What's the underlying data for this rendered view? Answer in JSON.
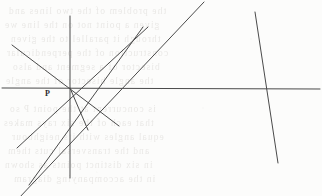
{
  "figure": {
    "width": 322,
    "height": 196,
    "background_color": "#fcfcfb",
    "ink_color": "#4a4a4a",
    "labels": [
      {
        "name": "point-p",
        "text": "P",
        "x": 45,
        "y": 90,
        "color": "#2b2b2b"
      }
    ]
  },
  "chart_data": {
    "type": "line",
    "title": "",
    "xlabel": "",
    "ylabel": "",
    "xlim": [
      0,
      322
    ],
    "ylim": [
      0,
      196
    ],
    "grid": false,
    "legend": "none",
    "coordinate_note": "Pixel coordinates, origin at top-left of the 322x196 image.",
    "key_points": [
      {
        "name": "P",
        "label": "P",
        "x": 70,
        "y": 88
      },
      {
        "name": "Q",
        "label": "",
        "x": 176,
        "y": 88
      },
      {
        "name": "R",
        "label": "",
        "x": 267,
        "y": 89
      }
    ],
    "series": [
      {
        "name": "horizontal-transversal",
        "stroke": "#4a4a4a",
        "width": 1.0,
        "x": [
          2,
          320
        ],
        "y": [
          88,
          89
        ]
      },
      {
        "name": "vertical-line-through-p",
        "stroke": "#4a4a4a",
        "width": 1.0,
        "x": [
          70,
          70
        ],
        "y": [
          16,
          178
        ]
      },
      {
        "name": "diagonal-upper-left-to-lower-right",
        "stroke": "#4a4a4a",
        "width": 1.0,
        "x": [
          12,
          119
        ],
        "y": [
          45,
          126
        ]
      },
      {
        "name": "diagonal-lower-left-to-upper-right",
        "stroke": "#4a4a4a",
        "width": 1.0,
        "x": [
          17,
          148
        ],
        "y": [
          148,
          27
        ]
      },
      {
        "name": "steep-line-through-p-to-lower-right",
        "stroke": "#4a4a4a",
        "width": 1.0,
        "x": [
          70,
          88
        ],
        "y": [
          88,
          130
        ]
      },
      {
        "name": "line-q-upper-left-to-lower-right",
        "stroke": "#4a4a4a",
        "width": 1.0,
        "x": [
          143,
          29
        ],
        "y": [
          27,
          185
        ]
      },
      {
        "name": "line-q-upper-right-to-lower-left",
        "stroke": "#4a4a4a",
        "width": 1.0,
        "x": [
          204,
          2
        ],
        "y": [
          2,
          216
        ]
      },
      {
        "name": "steep-line-right-crossing-transversal",
        "stroke": "#4a4a4a",
        "width": 1.0,
        "x": [
          255,
          278
        ],
        "y": [
          12,
          163
        ]
      }
    ]
  },
  "bleed_through_text": {
    "note": "Faint mirrored text showing through from the reverse side of the page; illegible.",
    "color": "#8a8279",
    "lines": [
      {
        "text": "the problem of the two lines and",
        "x": 8,
        "y": 6
      },
      {
        "text": "given a point not on the line we",
        "x": 4,
        "y": 20
      },
      {
        "text": "through it parallel to the given",
        "x": 10,
        "y": 34
      },
      {
        "text": "construction of the perpendicular",
        "x": 6,
        "y": 48
      },
      {
        "text": "bisector of a segment and also",
        "x": 12,
        "y": 62
      },
      {
        "text": "the angle bisector of the angle",
        "x": 5,
        "y": 76
      },
      {
        "text": "is concurrent at the point P so",
        "x": 9,
        "y": 104
      },
      {
        "text": "that each of the six rays makes",
        "x": 3,
        "y": 118
      },
      {
        "text": "equal angles with its neighbour",
        "x": 11,
        "y": 132
      },
      {
        "text": "and the transversal cuts them",
        "x": 7,
        "y": 146
      },
      {
        "text": "in six distinct points as shown",
        "x": 4,
        "y": 160
      },
      {
        "text": "in the accompanying diagram",
        "x": 13,
        "y": 174
      }
    ]
  }
}
